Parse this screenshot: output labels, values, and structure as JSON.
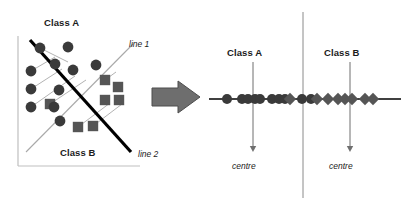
{
  "figure": {
    "type": "diagram"
  },
  "colors": {
    "class_a_marker": "#3a3a3a",
    "class_b_marker": "#555555",
    "separating_line": "#000000",
    "projection_line": "#a9a9a9",
    "axis": "#bfbfbf",
    "arrow_fill": "#6e6e6e",
    "arrow_stroke": "#4d4d4d",
    "text": "#1b1b1b",
    "number_line": "#000000",
    "divider": "#8a8a8a",
    "background": "#ffffff"
  },
  "left_panel": {
    "name": "scatter-plot",
    "labels": {
      "class_a": "Class A",
      "class_b": "Class B",
      "line_1": "line 1",
      "line_2": "line 2"
    },
    "axis": {
      "x_from": [
        18,
        166
      ],
      "x_to": [
        140,
        166
      ],
      "y_from": [
        18,
        36
      ],
      "y_to": [
        18,
        166
      ]
    },
    "separating_line": {
      "from": [
        30,
        40
      ],
      "to": [
        131,
        152
      ],
      "width": 3.2
    },
    "projection_line": {
      "from": [
        26,
        152
      ],
      "to": [
        133,
        44
      ],
      "width": 1.1
    },
    "class_a_points": [
      [
        40,
        48
      ],
      [
        68,
        47
      ],
      [
        55,
        64
      ],
      [
        73,
        70
      ],
      [
        96,
        65
      ],
      [
        31,
        71
      ],
      [
        31,
        89
      ],
      [
        31,
        107
      ],
      [
        54,
        107
      ],
      [
        59,
        90
      ],
      [
        60,
        121
      ]
    ],
    "class_b_points": [
      [
        105,
        80
      ],
      [
        118,
        87
      ],
      [
        105,
        100
      ],
      [
        119,
        100
      ],
      [
        50,
        104
      ],
      [
        78,
        127
      ],
      [
        93,
        126
      ]
    ],
    "connector_lines": [
      {
        "from": [
          40,
          48
        ],
        "to": [
          68,
          62
        ]
      },
      {
        "from": [
          31,
          71
        ],
        "to": [
          55,
          57
        ]
      },
      {
        "from": [
          31,
          89
        ],
        "to": [
          62,
          69
        ]
      },
      {
        "from": [
          31,
          107
        ],
        "to": [
          75,
          76
        ]
      },
      {
        "from": [
          50,
          104
        ],
        "to": [
          86,
          80
        ]
      },
      {
        "from": [
          78,
          127
        ],
        "to": [
          110,
          103
        ]
      },
      {
        "from": [
          93,
          126
        ],
        "to": [
          122,
          104
        ]
      },
      {
        "from": [
          105,
          80
        ],
        "to": [
          116,
          72
        ]
      }
    ]
  },
  "arrow": {
    "name": "transform-arrow",
    "shape": "block-arrow-right",
    "from_x": 152,
    "to_x": 200,
    "center_y": 97
  },
  "right_panel": {
    "name": "projected-number-line",
    "labels": {
      "class_a": "Class A",
      "class_b": "Class B",
      "centre_a": "centre",
      "centre_b": "centre"
    },
    "number_line": {
      "from_x": 4,
      "to_x": 196,
      "y": 99
    },
    "divider": {
      "x": 98,
      "from_y": 12,
      "to_y": 198
    },
    "centre_arrow_a": {
      "x": 48,
      "from_y": 62,
      "to_y": 152
    },
    "centre_arrow_b": {
      "x": 145,
      "from_y": 62,
      "to_y": 152
    },
    "markers": [
      {
        "x": 22,
        "shape": "circle",
        "fill": "#3a3a3a"
      },
      {
        "x": 37,
        "shape": "circle",
        "fill": "#3a3a3a"
      },
      {
        "x": 43,
        "shape": "circle",
        "fill": "#3a3a3a"
      },
      {
        "x": 50,
        "shape": "circle",
        "fill": "#3a3a3a"
      },
      {
        "x": 55,
        "shape": "circle",
        "fill": "#3a3a3a"
      },
      {
        "x": 67,
        "shape": "circle",
        "fill": "#3a3a3a"
      },
      {
        "x": 74,
        "shape": "circle",
        "fill": "#3a3a3a"
      },
      {
        "x": 80,
        "shape": "circle",
        "fill": "#3a3a3a"
      },
      {
        "x": 85,
        "shape": "diamond",
        "fill": "#555555"
      },
      {
        "x": 97,
        "shape": "circle",
        "fill": "#3a3a3a"
      },
      {
        "x": 106,
        "shape": "circle",
        "fill": "#3a3a3a"
      },
      {
        "x": 112,
        "shape": "diamond",
        "fill": "#555555"
      },
      {
        "x": 123,
        "shape": "diamond",
        "fill": "#555555"
      },
      {
        "x": 133,
        "shape": "diamond",
        "fill": "#555555"
      },
      {
        "x": 140,
        "shape": "diamond",
        "fill": "#555555"
      },
      {
        "x": 147,
        "shape": "diamond",
        "fill": "#555555"
      },
      {
        "x": 160,
        "shape": "diamond",
        "fill": "#555555"
      },
      {
        "x": 168,
        "shape": "diamond",
        "fill": "#555555"
      }
    ]
  }
}
